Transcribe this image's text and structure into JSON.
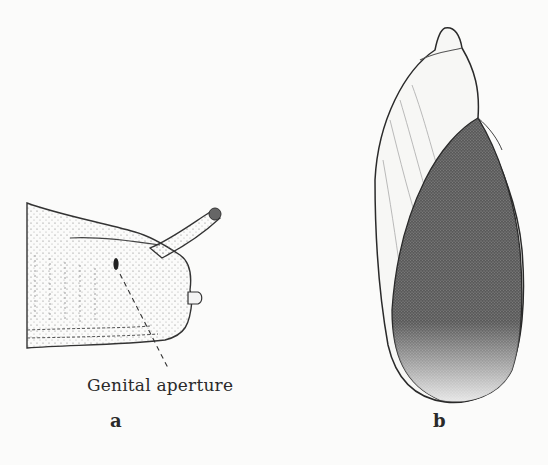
{
  "figure": {
    "panels": [
      {
        "id": "a",
        "label": "a",
        "subject": "slug head, lateral view"
      },
      {
        "id": "b",
        "label": "b",
        "subject": "snail shell, apertural view"
      }
    ],
    "annotations": [
      {
        "text": "Genital aperture",
        "panel": "a",
        "leader": "dashed"
      }
    ],
    "colors": {
      "background": "#fbfbfa",
      "ink": "#2a2a2a",
      "shading": "#555555"
    }
  }
}
